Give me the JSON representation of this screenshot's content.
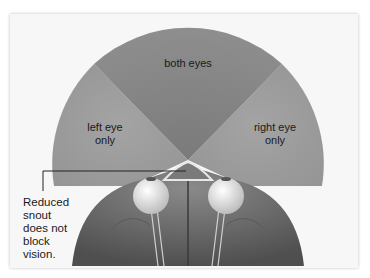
{
  "diagram": {
    "regions": [
      {
        "id": "both",
        "label": "both eyes",
        "color": "#8a8a8a"
      },
      {
        "id": "left",
        "label_line1": "left eye",
        "label_line2": "only",
        "color": "#9c9c9c"
      },
      {
        "id": "right",
        "label_line1": "right eye",
        "label_line2": "only",
        "color": "#9c9c9c"
      }
    ],
    "callout": {
      "lines": [
        "Reduced",
        "snout",
        "does not",
        "block",
        "vision."
      ]
    },
    "colors": {
      "background": "#f7f7f7",
      "brain": "#6e6e6e",
      "eye": "#eeeeee",
      "leader_line": "#222222"
    }
  }
}
